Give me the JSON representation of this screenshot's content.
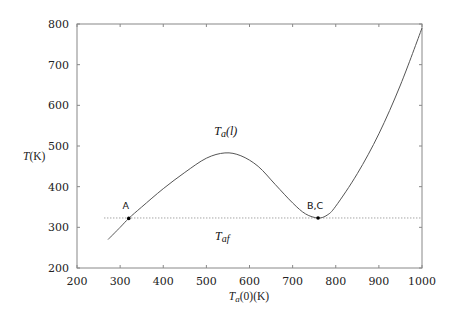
{
  "chart_data": {
    "type": "line",
    "title": "",
    "xlabel": "T_a(0) (K)",
    "ylabel": "T (K)",
    "xlim": [
      200,
      1000
    ],
    "ylim": [
      200,
      800
    ],
    "xticks": [
      200,
      300,
      400,
      500,
      600,
      700,
      800,
      900,
      1000
    ],
    "yticks": [
      200,
      300,
      400,
      500,
      600,
      700,
      800
    ],
    "grid": false,
    "legend": null,
    "series": [
      {
        "name": "T_a(l)",
        "style": "solid",
        "x": [
          272,
          300,
          320,
          350,
          400,
          450,
          500,
          543,
          580,
          620,
          660,
          700,
          730,
          759,
          780,
          800,
          850,
          900,
          950,
          1000
        ],
        "y": [
          270,
          300,
          322,
          350,
          395,
          435,
          470,
          483,
          476,
          450,
          405,
          360,
          333,
          323,
          330,
          352,
          432,
          530,
          650,
          790
        ]
      },
      {
        "name": "T_af",
        "style": "dotted",
        "x": [
          263,
          1000
        ],
        "y": [
          323,
          323
        ]
      }
    ],
    "points": [
      {
        "label": "A",
        "x": 320,
        "y": 322
      },
      {
        "label": "B,C",
        "x": 759,
        "y": 323
      }
    ],
    "annotations": [
      {
        "text": "T_a(l)",
        "base": "T",
        "sub": "a",
        "suffix": "(l)",
        "x": 545,
        "y": 527
      },
      {
        "text": "T_af",
        "base": "T",
        "sub": "af",
        "suffix": "",
        "x": 537,
        "y": 270
      }
    ]
  },
  "labels": {
    "ylabel_text": "T(K)",
    "xlabel_base": "T",
    "xlabel_sub": "a",
    "xlabel_suffix": "(0)(K)"
  }
}
